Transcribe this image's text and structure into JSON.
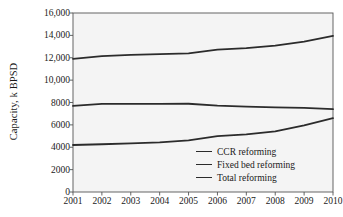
{
  "chart_data": {
    "type": "line",
    "title": "",
    "xlabel": "",
    "ylabel": "Capacity, k BPSD",
    "categories": [
      "2001",
      "2002",
      "2003",
      "2004",
      "2005",
      "2006",
      "2007",
      "2008",
      "2009",
      "2010"
    ],
    "x": [
      2001,
      2002,
      2003,
      2004,
      2005,
      2006,
      2007,
      2008,
      2009,
      2010
    ],
    "xlim": [
      2001,
      2010
    ],
    "ylim": [
      0,
      16000
    ],
    "yticks": [
      0,
      2000,
      4000,
      6000,
      8000,
      10000,
      12000,
      14000,
      16000
    ],
    "ytick_labels": [
      "0",
      "2000",
      "4000",
      "6000",
      "8000",
      "10,000",
      "12,000",
      "14,000",
      "16,000"
    ],
    "grid": false,
    "legend_position": "lower-right",
    "series": [
      {
        "name": "CCR reforming",
        "color": "#2b2b2b",
        "values": [
          4200,
          4270,
          4350,
          4430,
          4620,
          5000,
          5150,
          5420,
          5950,
          6600
        ]
      },
      {
        "name": "Fixed bed reforming",
        "color": "#2b2b2b",
        "values": [
          7700,
          7870,
          7880,
          7880,
          7890,
          7720,
          7640,
          7570,
          7520,
          7400
        ]
      },
      {
        "name": "Total reforming",
        "color": "#2b2b2b",
        "values": [
          11900,
          12140,
          12250,
          12330,
          12400,
          12720,
          12860,
          13080,
          13450,
          13950
        ]
      }
    ]
  },
  "legend": {
    "items": [
      {
        "label": "CCR reforming"
      },
      {
        "label": "Fixed bed reforming"
      },
      {
        "label": "Total reforming"
      }
    ]
  },
  "colors": {
    "line": "#2b2b2b",
    "axis": "#555555",
    "plot_background": "#f4f4f4",
    "text": "#1a1a1a"
  }
}
